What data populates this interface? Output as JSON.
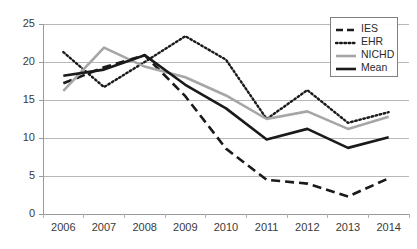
{
  "chart_data": {
    "type": "line",
    "title": "",
    "xlabel": "",
    "ylabel": "",
    "categories": [
      "2006",
      "2007",
      "2008",
      "2009",
      "2010",
      "2011",
      "2012",
      "2013",
      "2014"
    ],
    "x": [
      2006,
      2007,
      2008,
      2009,
      2010,
      2011,
      2012,
      2013,
      2014
    ],
    "ylim": [
      0,
      25
    ],
    "yticks": [
      0,
      5,
      10,
      15,
      20,
      25
    ],
    "ytick_labels": [
      "0",
      "5",
      "10",
      "15",
      "20",
      "25"
    ],
    "grid": "horizontal",
    "legend_position": "top-right",
    "series": [
      {
        "name": "IES",
        "style": "dashed",
        "color": "#1a1a1a",
        "values": [
          17.2,
          19.3,
          20.9,
          15.5,
          8.6,
          4.5,
          4.0,
          2.3,
          4.7
        ]
      },
      {
        "name": "EHR",
        "style": "dotted",
        "color": "#1a1a1a",
        "values": [
          21.3,
          16.7,
          20.0,
          23.4,
          20.3,
          12.5,
          16.3,
          12.0,
          13.4
        ]
      },
      {
        "name": "NICHD",
        "style": "solid",
        "color": "#a6a6a6",
        "values": [
          16.2,
          21.9,
          19.4,
          18.0,
          15.6,
          12.5,
          13.5,
          11.2,
          12.8
        ]
      },
      {
        "name": "Mean",
        "style": "solid",
        "color": "#1a1a1a",
        "values": [
          18.2,
          19.0,
          20.9,
          17.0,
          13.9,
          9.8,
          11.2,
          8.7,
          10.1
        ]
      }
    ]
  },
  "legend": {
    "items": [
      {
        "label": "IES",
        "swatch": "dashed-line-swatch"
      },
      {
        "label": "EHR",
        "swatch": "dotted-line-swatch"
      },
      {
        "label": "NICHD",
        "swatch": "gray-solid-line-swatch"
      },
      {
        "label": "Mean",
        "swatch": "black-solid-line-swatch"
      }
    ]
  }
}
